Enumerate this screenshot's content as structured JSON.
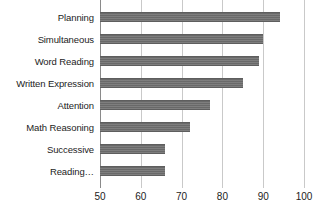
{
  "chart_data": {
    "type": "bar",
    "orientation": "horizontal",
    "title": "",
    "subtitle": "",
    "xlabel": "",
    "ylabel": "",
    "xlim": [
      50,
      100
    ],
    "ylim": null,
    "grid": true,
    "gridlines_axis": "x",
    "legend": false,
    "legend_position": "none",
    "bar_color": "#6f6f6f",
    "background_color": "#ffffff",
    "categories": [
      "Planning",
      "Simultaneous",
      "Word Reading",
      "Written Expression",
      "Attention",
      "Math Reasoning",
      "Successive",
      "Reading…"
    ],
    "values": [
      94,
      90,
      89,
      85,
      77,
      72,
      66,
      66
    ],
    "xticks": [
      50,
      60,
      70,
      80,
      90,
      100
    ],
    "xtick_labels": [
      "50",
      "60",
      "70",
      "80",
      "90",
      "100"
    ],
    "annotations": []
  }
}
